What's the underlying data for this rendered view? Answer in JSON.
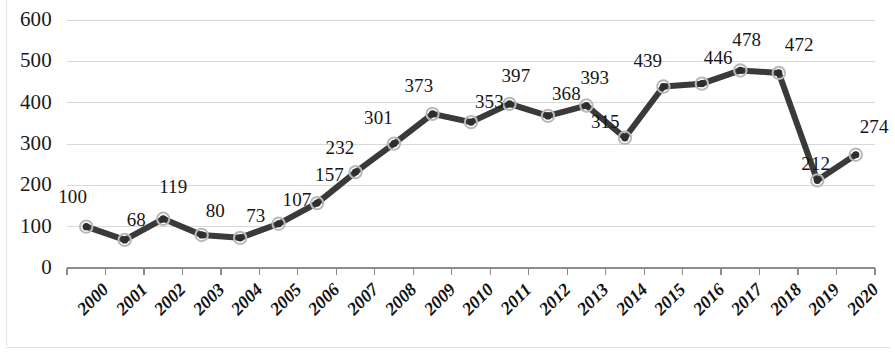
{
  "chart_data": {
    "type": "line",
    "title": "",
    "subtitle": "",
    "xlabel": "",
    "ylabel": "",
    "categories": [
      "2000",
      "2001",
      "2002",
      "2003",
      "2004",
      "2005",
      "2006",
      "2007",
      "2008",
      "2009",
      "2010",
      "2011",
      "2012",
      "2013",
      "2014",
      "2015",
      "2016",
      "2017",
      "2018",
      "2019",
      "2020"
    ],
    "values": [
      100,
      68,
      119,
      80,
      73,
      107,
      157,
      232,
      301,
      373,
      353,
      397,
      368,
      393,
      315,
      439,
      446,
      478,
      472,
      212,
      274
    ],
    "series": [
      {
        "name": "",
        "values": [
          100,
          68,
          119,
          80,
          73,
          107,
          157,
          232,
          301,
          373,
          353,
          397,
          368,
          393,
          315,
          439,
          446,
          478,
          472,
          212,
          274
        ]
      }
    ],
    "data_labels": [
      "100",
      "68",
      "119",
      "80",
      "73",
      "107",
      "157",
      "232",
      "301",
      "373",
      "353",
      "397",
      "368",
      "393",
      "315",
      "439",
      "446",
      "478",
      "472",
      "212",
      "274"
    ],
    "ylim": [
      0,
      600
    ],
    "yticks": [
      0,
      100,
      200,
      300,
      400,
      500,
      600
    ],
    "ytick_labels": [
      "0",
      "100",
      "200",
      "300",
      "400",
      "500",
      "600"
    ],
    "grid": true,
    "grid_axis": "y",
    "legend": false,
    "legend_position": "none",
    "marker": "circle",
    "line_color": "#3a3a3a",
    "marker_face_color": "#2e2e2e",
    "marker_edge_color": "#b9b9b9",
    "grid_color": "#d9d9d9",
    "axis_color": "#8c8c8c",
    "text_color": "#1a1a1a",
    "background_color": "#ffffff"
  }
}
